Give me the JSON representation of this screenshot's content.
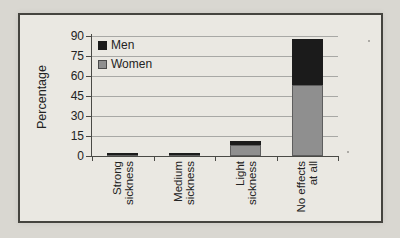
{
  "chart_data": {
    "type": "bar",
    "stacked": true,
    "title": "",
    "ylabel": "Percentage",
    "xlabel": "",
    "categories": [
      "Strong sickness",
      "Medium sickness",
      "Light sickness",
      "No effects at all"
    ],
    "category_label_lines": [
      [
        "Strong",
        "sickness"
      ],
      [
        "Medium",
        "sickness"
      ],
      [
        "Light",
        "sickness"
      ],
      [
        "No effects",
        "at all"
      ]
    ],
    "series": [
      {
        "name": "Women",
        "color": "#8f8f8f",
        "values": [
          1,
          1,
          8,
          53
        ]
      },
      {
        "name": "Men",
        "color": "#1b1b1b",
        "values": [
          1,
          1,
          3,
          35
        ]
      }
    ],
    "yticks": [
      0,
      15,
      30,
      45,
      60,
      75,
      90
    ],
    "ylim": [
      0,
      90
    ],
    "grid": "horizontal",
    "legend_position": "inside-top-left",
    "legend_order": [
      "Men",
      "Women"
    ]
  },
  "legend": {
    "items": [
      {
        "label": "Men",
        "color": "#1b1b1b"
      },
      {
        "label": "Women",
        "color": "#8f8f8f"
      }
    ]
  },
  "colors": {
    "page_background": "#d9d7d1",
    "chart_background": "#eae8e2",
    "frame_border": "#45443f",
    "gridline": "#a8a8a5",
    "axis": "#4a4a46",
    "text": "#232323"
  }
}
